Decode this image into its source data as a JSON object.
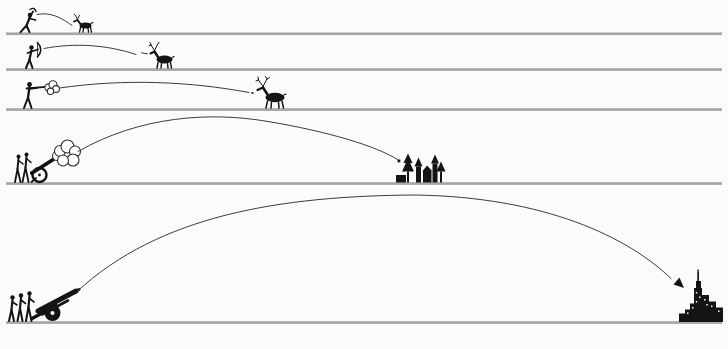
{
  "diagram": {
    "name": "historical-projectile-range-comparison",
    "rows": [
      {
        "id": 1,
        "shooter_icon": "spear-thrower-icon",
        "projectile_icon": "thrown-spear-trajectory",
        "target_icon": "antelope-icon",
        "range_rank": "shortest"
      },
      {
        "id": 2,
        "shooter_icon": "archer-icon",
        "projectile_icon": "arrow-trajectory",
        "target_icon": "deer-icon",
        "range_rank": "short"
      },
      {
        "id": 3,
        "shooter_icon": "musketeer-icon",
        "projectile_icon": "musket-ball-trajectory",
        "target_icon": "elk-icon",
        "range_rank": "medium"
      },
      {
        "id": 4,
        "shooter_icon": "field-cannon-icon",
        "projectile_icon": "cannonball-trajectory",
        "target_icon": "village-icon",
        "range_rank": "long"
      },
      {
        "id": 5,
        "shooter_icon": "howitzer-icon",
        "projectile_icon": "artillery-shell-trajectory",
        "target_icon": "city-skyline-icon",
        "range_rank": "longest"
      }
    ]
  },
  "colors": {
    "background": "#fbfbfa",
    "silhouette": "#141414",
    "ground_line": "#a6a6a6",
    "trajectory": "#3c3c3c",
    "smoke_fill": "#ffffff",
    "smoke_outline": "#2e2e2e"
  }
}
